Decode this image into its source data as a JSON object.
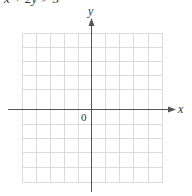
{
  "header": {
    "equation_cut_off": "x + 2y > 5"
  },
  "axes": {
    "x_label": "x",
    "y_label": "y",
    "origin_label": "0"
  },
  "grid": {
    "columns": 10,
    "rows": 11,
    "line_color": "#d9d9d9",
    "axis_color": "#555555"
  }
}
